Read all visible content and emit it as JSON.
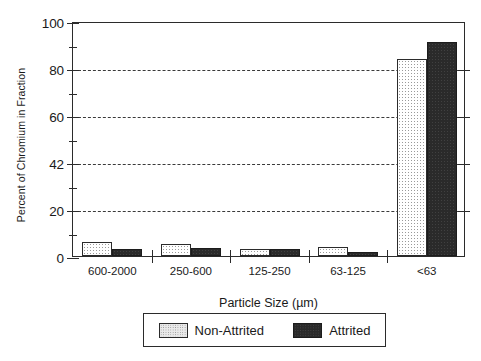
{
  "chart_data": {
    "type": "bar",
    "title": "",
    "xlabel": "Particle Size (µm)",
    "ylabel": "Percent of Chromium in Fraction",
    "categories": [
      "600-2000",
      "250-600",
      "125-250",
      "63-125",
      "<63"
    ],
    "series": [
      {
        "name": "Non-Attrited",
        "values": [
          6,
          5,
          3,
          4,
          84
        ],
        "color": "#ffffff",
        "pattern": "stippled-light"
      },
      {
        "name": "Attrited",
        "values": [
          3,
          3.5,
          3,
          1.5,
          91
        ],
        "color": "#2a2a2a",
        "pattern": "solid-dark"
      }
    ],
    "ylim": [
      0,
      100
    ],
    "ytick_labels": [
      "0",
      "20",
      "42",
      "60",
      "80",
      "100"
    ],
    "ytick_values": [
      0,
      20,
      40,
      60,
      80,
      100
    ],
    "yminor_values": [
      10,
      30,
      50,
      70,
      90
    ],
    "grid": "horizontal-dashed",
    "legend_position": "below-plot",
    "frame": "box"
  },
  "legend": {
    "entries": [
      {
        "label": "Non-Attrited"
      },
      {
        "label": "Attrited"
      }
    ]
  }
}
